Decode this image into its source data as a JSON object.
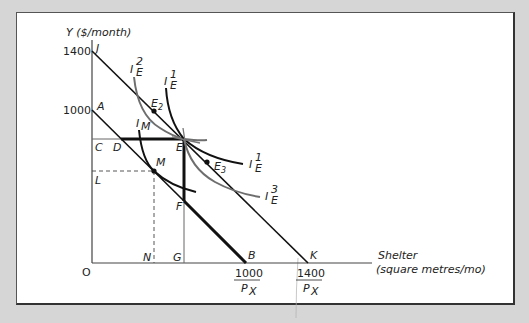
{
  "diagram": {
    "y_axis_label": "Y ($/month)",
    "y_ticks": [
      {
        "label": "1400",
        "point": "J"
      },
      {
        "label": "1000",
        "point": "A"
      }
    ],
    "x_axis_label_line1": "Shelter",
    "x_axis_label_line2": "(square metres/mo)",
    "x_ticks": [
      {
        "numerator": "1000",
        "denominator": "P",
        "subscript": "X",
        "point": "B"
      },
      {
        "numerator": "1400",
        "denominator": "P",
        "subscript": "X",
        "point": "K"
      }
    ],
    "origin_label": "O",
    "point_labels": {
      "J": "J",
      "A": "A",
      "C": "C",
      "D": "D",
      "E": "E",
      "M": "M",
      "L": "L",
      "F": "F",
      "N": "N",
      "G": "G",
      "B": "B",
      "K": "K",
      "E2": "E",
      "E2_sub": "2",
      "E3": "E",
      "E3_sub": "3"
    },
    "curves": [
      {
        "id": "IE2",
        "base": "I",
        "sub": "E",
        "sup": "2",
        "color": "#6e6e6e"
      },
      {
        "id": "IE1_top",
        "base": "I",
        "sub": "E",
        "sup": "1",
        "color": "#111111"
      },
      {
        "id": "IM",
        "base": "I",
        "sub": "M",
        "sup": "",
        "color": "#111111"
      },
      {
        "id": "IE1_right",
        "base": "I",
        "sub": "E",
        "sup": "1",
        "color": "#111111"
      },
      {
        "id": "IE3",
        "base": "I",
        "sub": "E",
        "sup": "3",
        "color": "#6e6e6e"
      }
    ],
    "lines": {
      "budget_JK": "J to K",
      "budget_AB": "A to B",
      "kinked_constraint": "C-D-E-F-B"
    },
    "colors": {
      "frame_bg": "#ffffff",
      "page_bg": "#d6d6d6",
      "ink": "#111111",
      "gray_curve": "#6e6e6e",
      "axis": "#444444"
    }
  }
}
